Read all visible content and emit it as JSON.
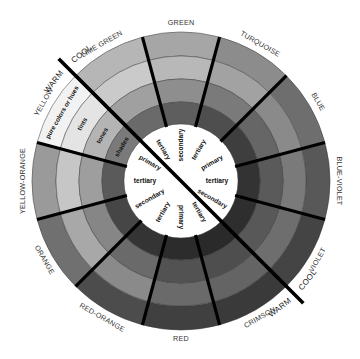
{
  "diagram": {
    "center": [
      181,
      181
    ],
    "radii": {
      "outer": 149,
      "ring1": 125,
      "ring2": 102,
      "ring3": 79,
      "ring4": 57,
      "hub": 56
    },
    "ring_labels": [
      "pure colors or hues",
      "tints",
      "tones",
      "shades"
    ],
    "segments": [
      {
        "name": "GREEN",
        "type": "secondary",
        "shades": [
          "#a6a6a6",
          "#b8b8b8",
          "#8e8e8e",
          "#5e5e5e"
        ]
      },
      {
        "name": "TURQUOISE",
        "type": "tertiary",
        "shades": [
          "#8c8c8c",
          "#a2a2a2",
          "#7a7a7a",
          "#4e4e4e"
        ]
      },
      {
        "name": "BLUE",
        "type": "primary",
        "shades": [
          "#6e6e6e",
          "#8a8a8a",
          "#666666",
          "#3e3e3e"
        ]
      },
      {
        "name": "BLUE-VIOLET",
        "type": "tertiary",
        "shades": [
          "#585858",
          "#7a7a7a",
          "#5a5a5a",
          "#333333"
        ]
      },
      {
        "name": "VIOLET",
        "type": "secondary",
        "shades": [
          "#444444",
          "#6e6e6e",
          "#585858",
          "#2e2e2e"
        ]
      },
      {
        "name": "CRIMSON",
        "type": "tertiary",
        "shades": [
          "#3a3a3a",
          "#646464",
          "#4e4e4e",
          "#2a2a2a"
        ]
      },
      {
        "name": "RED",
        "type": "primary",
        "shades": [
          "#404040",
          "#6a6a6a",
          "#525252",
          "#2c2c2c"
        ]
      },
      {
        "name": "RED-ORANGE",
        "type": "tertiary",
        "shades": [
          "#4c4c4c",
          "#8a8a8a",
          "#6a6a6a",
          "#343434"
        ]
      },
      {
        "name": "ORANGE",
        "type": "secondary",
        "shades": [
          "#707070",
          "#a8a8a8",
          "#868686",
          "#464646"
        ]
      },
      {
        "name": "YELLOW-ORANGE",
        "type": "tertiary",
        "shades": [
          "#9a9a9a",
          "#c6c6c6",
          "#9e9e9e",
          "#5a5a5a"
        ]
      },
      {
        "name": "YELLOW",
        "type": "primary",
        "shades": [
          "#f2f2f2",
          "#e4e4e4",
          "#b4b4b4",
          "#7a7a7a"
        ]
      },
      {
        "name": "LIME GREEN",
        "type": "tertiary",
        "shades": [
          "#b6b6b6",
          "#cacaca",
          "#a0a0a0",
          "#6a6a6a"
        ]
      }
    ],
    "divider": {
      "labels_upper": {
        "warm": "WARM",
        "cool": "COOL"
      },
      "labels_lower": {
        "warm": "WARM",
        "cool": "COOL"
      }
    },
    "colors": {
      "spoke": "#000000",
      "hub": "#ffffff",
      "ring_line": "#3a3a3a"
    }
  }
}
